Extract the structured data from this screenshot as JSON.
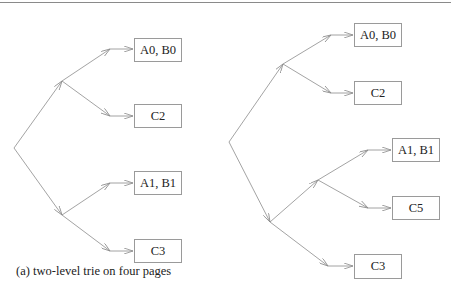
{
  "diagram_a": {
    "caption": "(a) two-level trie on four pages",
    "pages": [
      {
        "label": "A0, B0"
      },
      {
        "label": "C2"
      },
      {
        "label": "A1, B1"
      },
      {
        "label": "C3"
      }
    ]
  },
  "diagram_b": {
    "pages": [
      {
        "label": "A0, B0"
      },
      {
        "label": "C2"
      },
      {
        "label": "A1, B1"
      },
      {
        "label": "C5"
      },
      {
        "label": "C3"
      }
    ]
  },
  "colors": {
    "edge": "#8c8c8c",
    "box_border": "#9a9a9a",
    "text": "#222222",
    "rule": "#8a8a8a"
  }
}
